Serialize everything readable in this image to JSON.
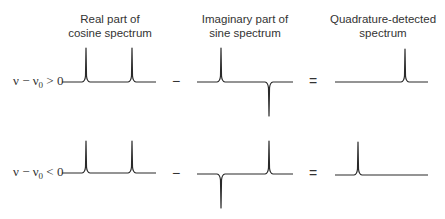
{
  "columns": [
    {
      "title_line1": "Real part of",
      "title_line2": "cosine spectrum"
    },
    {
      "title_line1": "Imaginary part of",
      "title_line2": "sine spectrum"
    },
    {
      "title_line1": "Quadrature-detected",
      "title_line2": "spectrum"
    }
  ],
  "rows": [
    {
      "label_var": "ν − ν",
      "label_sub": "0",
      "label_rel": " > 0",
      "cosine_peaks": [
        "up",
        "up"
      ],
      "sine_peaks": [
        "up",
        "down"
      ],
      "result_peak": "right"
    },
    {
      "label_var": "ν − ν",
      "label_sub": "0",
      "label_rel": " < 0",
      "cosine_peaks": [
        "up",
        "up"
      ],
      "sine_peaks": [
        "down",
        "up"
      ],
      "result_peak": "left"
    }
  ],
  "operators": {
    "minus": "−",
    "equals": "="
  },
  "colors": {
    "line": "#2a2a2a",
    "background": "#ffffff"
  }
}
